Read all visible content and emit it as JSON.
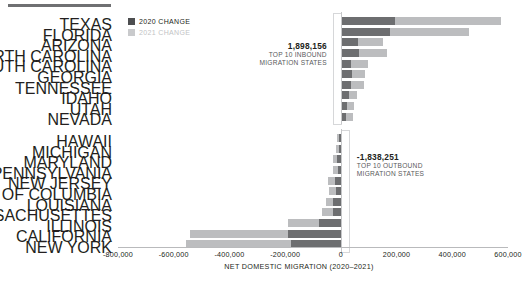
{
  "legend": {
    "items": [
      {
        "label": "2020 CHANGE",
        "color": "#4d4e50",
        "key": "2020"
      },
      {
        "label": "2021 CHANGE",
        "color": "#c9cacc",
        "key": "2021"
      }
    ]
  },
  "annotations": {
    "inbound": {
      "value": "1,898,156",
      "line1": "TOP 10 INBOUND",
      "line2": "MIGRATION STATES"
    },
    "outbound": {
      "value": "-1,838,251",
      "line1": "TOP 10 OUTBOUND",
      "line2": "MIGRATION STATES"
    }
  },
  "chart_data": {
    "type": "bar",
    "orientation": "horizontal",
    "stacked": true,
    "title": "",
    "xlabel": "NET DOMESTIC MIGRATION (2020–2021)",
    "ylabel": "",
    "xlim": [
      -800000,
      600000
    ],
    "xticks": [
      -800000,
      -600000,
      -400000,
      -200000,
      0,
      200000,
      400000,
      600000
    ],
    "xtick_labels": [
      "-800,000",
      "-600,000",
      "-400,000",
      "-200,000",
      "0",
      "200,000",
      "400,000",
      "600,000"
    ],
    "grid": false,
    "legend_position": "top-left",
    "series": [
      {
        "name": "2020 CHANGE",
        "color": "#6d6e70"
      },
      {
        "name": "2021 CHANGE",
        "color": "#bcbdbf"
      }
    ],
    "groups": [
      {
        "name": "TOP 10 INBOUND MIGRATION STATES",
        "total": 1898156,
        "categories": [
          "TEXAS",
          "FLORIDA",
          "ARIZONA",
          "NORTH CAROLINA",
          "SOUTH CAROLINA",
          "GEORGIA",
          "TENNESSEE",
          "IDAHO",
          "UTAH",
          "NEVADA"
        ],
        "values_2020": [
          195000,
          175000,
          60000,
          65000,
          38000,
          40000,
          38000,
          30000,
          22000,
          20000
        ],
        "values_2021": [
          380000,
          285000,
          93000,
          100000,
          60000,
          48000,
          44000,
          28000,
          25000,
          22000
        ]
      },
      {
        "name": "TOP 10 OUTBOUND MIGRATION STATES",
        "total": -1838251,
        "categories": [
          "HAWAII",
          "MICHIGAN",
          "MARYLAND",
          "PENNSYLVANIA",
          "NEW JERSEY",
          "DISTRICT OF COLUMBIA",
          "LOUISIANA",
          "MASSACHUSETTES",
          "ILLINOIS",
          "CALIFORNIA",
          "NEW YORK"
        ],
        "values_2020": [
          -6000,
          -7000,
          -13000,
          -12000,
          -22000,
          -19000,
          -27000,
          -27000,
          -80000,
          -190000,
          -180000
        ],
        "values_2021": [
          -7000,
          -10000,
          -14000,
          -16000,
          -25000,
          -23000,
          -28000,
          -40000,
          -110000,
          -350000,
          -375000
        ]
      }
    ]
  }
}
